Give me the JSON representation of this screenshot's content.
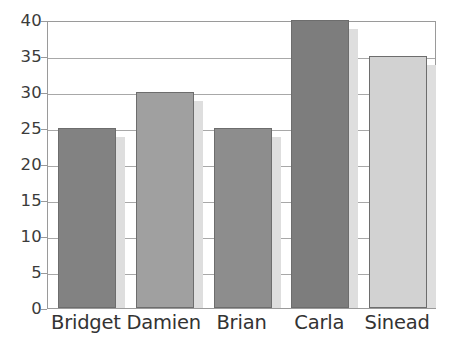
{
  "chart_data": {
    "type": "bar",
    "title": "",
    "subtitle": "",
    "xlabel": "",
    "ylabel": "",
    "categories": [
      "Bridget",
      "Damien",
      "Brian",
      "Carla",
      "Sinead"
    ],
    "values": [
      25,
      30,
      25,
      40,
      35
    ],
    "series": [
      {
        "name": "",
        "values": [
          25,
          30,
          25,
          40,
          35
        ]
      }
    ],
    "bar_colors": [
      "#828282",
      "#a0a0a0",
      "#8d8d8d",
      "#7d7d7d",
      "#d2d2d2"
    ],
    "bar_border_color": "#6d6d6d",
    "bar_shadow_color": "#dedede",
    "ylim": [
      0,
      40
    ],
    "ytick_values": [
      0,
      5,
      10,
      15,
      20,
      25,
      30,
      35,
      40
    ],
    "ytick_labels": [
      "0",
      "5",
      "10",
      "15",
      "20",
      "25",
      "30",
      "35",
      "40"
    ],
    "grid": true,
    "grid_axis": "y",
    "gridline_color": "#a8a8a8",
    "legend": false,
    "legend_position": "none",
    "plot_border_color": "#9a9a9a",
    "background_color": "#ffffff",
    "axis_text_color": "#3b3b3b",
    "category_text_color": "#333333",
    "annotations": []
  }
}
